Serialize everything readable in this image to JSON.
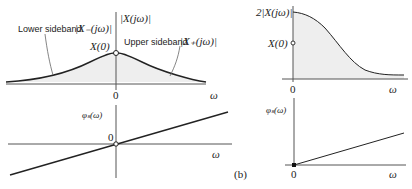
{
  "figure_label": "(b)",
  "left_magnitude": {
    "y_label": "|X(jω)|",
    "peak_label": "X(0)",
    "lower_sideband_label": "Lower sideband",
    "lower_sideband_symbol": "|X₋(jω)|",
    "upper_sideband_label": "Upper sideband",
    "upper_sideband_symbol": "|X₊(jω)|",
    "origin_label": "0",
    "x_label": "ω"
  },
  "left_phase": {
    "y_label": "φₛ(ω)",
    "origin_label": "0",
    "x_label": "ω"
  },
  "right_magnitude": {
    "y_label": "2|X(jω)|",
    "marker_label": "X(0)",
    "origin_label": "0",
    "x_label": "ω"
  },
  "right_phase": {
    "y_label": "φₛ(ω)",
    "origin_label": "0",
    "x_label": "ω"
  },
  "colors": {
    "curve": "#222222",
    "axis": "#555555",
    "fill": "#eeeeee"
  }
}
